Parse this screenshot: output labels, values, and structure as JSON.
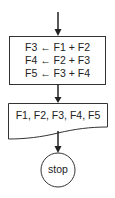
{
  "flowchart": {
    "process": {
      "lines": [
        "F3 ← F1 + F2",
        "F4 ← F2 + F3",
        "F5 ← F3 + F4"
      ]
    },
    "output": {
      "label": "F1, F2, F3, F4, F5"
    },
    "terminal": {
      "label": "stop"
    },
    "colors": {
      "stroke": "#333333",
      "background": "#ffffff"
    }
  }
}
